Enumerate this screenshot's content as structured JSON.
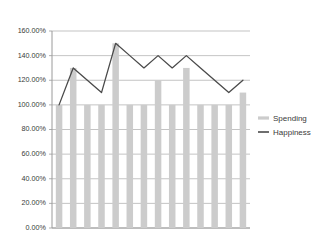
{
  "chart_data": {
    "type": "bar",
    "title": "",
    "xlabel": "",
    "ylabel": "",
    "ylim": [
      0,
      160
    ],
    "ytick_step": 20,
    "grid": true,
    "legend_position": "right",
    "categories": [
      "1",
      "2",
      "3",
      "4",
      "5",
      "6",
      "7",
      "8",
      "9",
      "10",
      "11",
      "12",
      "13",
      "14"
    ],
    "ytick_labels": [
      "0.00%",
      "20.00%",
      "40.00%",
      "60.00%",
      "80.00%",
      "100.00%",
      "120.00%",
      "140.00%",
      "160.00%"
    ],
    "ytick_values": [
      0,
      20,
      40,
      60,
      80,
      100,
      120,
      140,
      160
    ],
    "series": [
      {
        "name": "Spending",
        "type": "bar",
        "color": "#cccccc",
        "values": [
          100,
          130,
          100,
          100,
          150,
          100,
          100,
          120,
          100,
          130,
          100,
          100,
          100,
          110
        ]
      },
      {
        "name": "Happiness",
        "type": "line",
        "color": "#4a4a4a",
        "values": [
          100,
          130,
          120,
          110,
          150,
          140,
          130,
          140,
          130,
          140,
          130,
          120,
          110,
          120
        ]
      }
    ]
  },
  "legend": {
    "items": [
      {
        "label": "Spending",
        "marker": "bar-swatch",
        "color": "#cccccc"
      },
      {
        "label": "Happiness",
        "marker": "line-swatch",
        "color": "#4a4a4a"
      }
    ]
  },
  "axes": {
    "y_axis_name": "y-axis",
    "x_axis_name": "x-axis"
  }
}
